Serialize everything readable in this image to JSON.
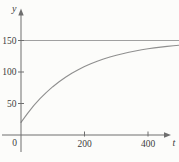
{
  "figure": {
    "background": "#fcfcfa",
    "axis_color": "#6e6e6e",
    "curve_color": "#8f8f8f",
    "asymptote_color": "#a0a0a0",
    "text_color": "#3c3c3c"
  },
  "chart_data": {
    "type": "line",
    "title": "",
    "xlabel": "t",
    "ylabel": "y",
    "origin_label": "0",
    "x_ticks": [
      200,
      400
    ],
    "y_ticks": [
      50,
      100,
      150
    ],
    "xlim": [
      0,
      500
    ],
    "ylim": [
      0,
      165
    ],
    "grid": false,
    "legend": "none",
    "asymptote_y": 150,
    "series": [
      {
        "name": "saturating-growth-curve",
        "x": [
          0,
          20,
          40,
          60,
          80,
          100,
          120,
          140,
          160,
          180,
          200,
          220,
          240,
          260,
          280,
          300,
          320,
          340,
          360,
          380,
          400,
          420,
          440,
          460,
          480,
          500
        ],
        "y": [
          20.0,
          34.0,
          46.6,
          57.7,
          67.7,
          76.6,
          84.5,
          91.6,
          97.9,
          103.5,
          108.5,
          113.0,
          117.0,
          120.6,
          123.8,
          126.6,
          129.1,
          131.4,
          133.4,
          135.2,
          136.8,
          138.2,
          139.5,
          140.6,
          141.6,
          142.5
        ]
      }
    ]
  }
}
